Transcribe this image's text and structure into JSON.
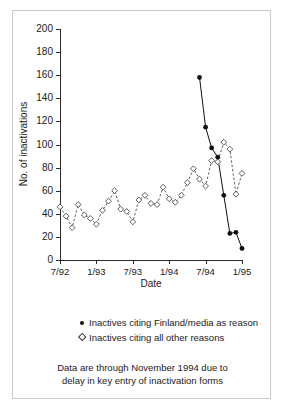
{
  "chart_data": {
    "type": "line",
    "title": "",
    "xlabel": "Date",
    "ylabel": "No. of inactivations",
    "ylim": [
      0,
      200
    ],
    "ytick_step": 20,
    "yticks": [
      0,
      20,
      40,
      60,
      80,
      100,
      120,
      140,
      160,
      180,
      200
    ],
    "xticks": [
      "7/92",
      "1/93",
      "7/93",
      "1/94",
      "7/94",
      "1/95"
    ],
    "xlim_months": [
      "7/92",
      "1/95"
    ],
    "grid": false,
    "legend_position": "below-axis",
    "note": "Data are through November 1994 due to delay in key entry of inactivation forms",
    "series": [
      {
        "name": "Inactives citing Finland/media as reason",
        "marker": "filled-circle",
        "line": "solid",
        "color": "#111111",
        "points": [
          {
            "x": "6/94",
            "y": 158
          },
          {
            "x": "7/94",
            "y": 115
          },
          {
            "x": "8/94",
            "y": 97
          },
          {
            "x": "9/94",
            "y": 89
          },
          {
            "x": "10/94",
            "y": 56
          },
          {
            "x": "11/94",
            "y": 23
          },
          {
            "x": "12/94",
            "y": 24
          },
          {
            "x": "1/95",
            "y": 10
          }
        ]
      },
      {
        "name": "Inactives citing all other reasons",
        "marker": "open-diamond",
        "line": "dashed",
        "color": "#333333",
        "points": [
          {
            "x": "7/92",
            "y": 46
          },
          {
            "x": "8/92",
            "y": 38
          },
          {
            "x": "9/92",
            "y": 28
          },
          {
            "x": "10/92",
            "y": 48
          },
          {
            "x": "11/92",
            "y": 39
          },
          {
            "x": "12/92",
            "y": 36
          },
          {
            "x": "1/93",
            "y": 31
          },
          {
            "x": "2/93",
            "y": 43
          },
          {
            "x": "3/93",
            "y": 51
          },
          {
            "x": "4/93",
            "y": 60
          },
          {
            "x": "5/93",
            "y": 44
          },
          {
            "x": "6/93",
            "y": 42
          },
          {
            "x": "7/93",
            "y": 33
          },
          {
            "x": "8/93",
            "y": 52
          },
          {
            "x": "9/93",
            "y": 56
          },
          {
            "x": "10/93",
            "y": 49
          },
          {
            "x": "11/93",
            "y": 48
          },
          {
            "x": "12/93",
            "y": 63
          },
          {
            "x": "1/94",
            "y": 53
          },
          {
            "x": "2/94",
            "y": 50
          },
          {
            "x": "3/94",
            "y": 56
          },
          {
            "x": "4/94",
            "y": 67
          },
          {
            "x": "5/94",
            "y": 79
          },
          {
            "x": "6/94",
            "y": 70
          },
          {
            "x": "7/94",
            "y": 64
          },
          {
            "x": "8/94",
            "y": 86
          },
          {
            "x": "9/94",
            "y": 85
          },
          {
            "x": "10/94",
            "y": 102
          },
          {
            "x": "11/94",
            "y": 96
          },
          {
            "x": "12/94",
            "y": 57
          },
          {
            "x": "1/95",
            "y": 75
          }
        ]
      }
    ]
  },
  "legend": {
    "items": [
      {
        "marker": "filled-circle",
        "label": "Inactives citing Finland/media as reason"
      },
      {
        "marker": "open-diamond",
        "label": "Inactives citing all other reasons"
      }
    ]
  },
  "note": {
    "line1": "Data are through November 1994 due to",
    "line2": "delay in key entry of inactivation forms"
  }
}
